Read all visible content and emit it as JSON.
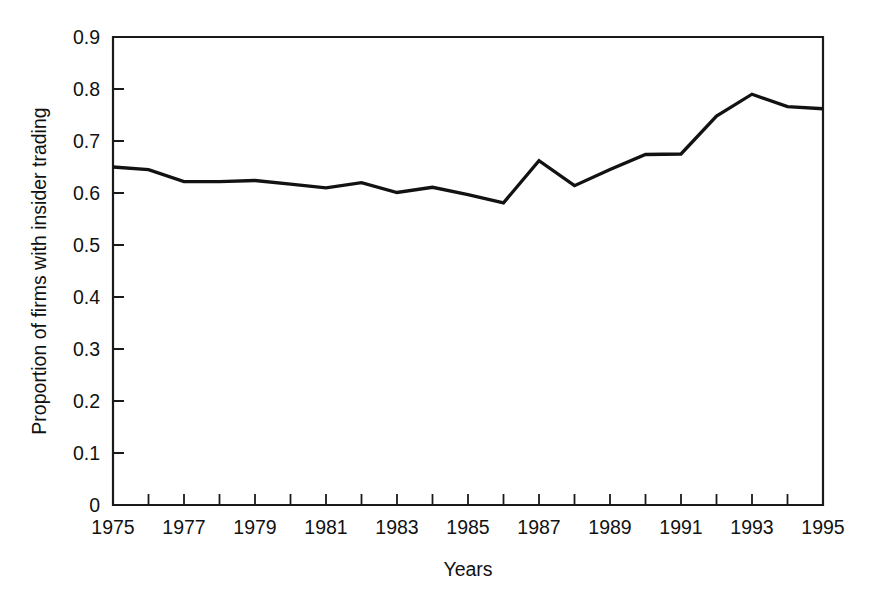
{
  "chart_data": {
    "type": "line",
    "title": "",
    "xlabel": "Years",
    "ylabel": "Proportion of firms with insider trading",
    "xlim": [
      1975,
      1995
    ],
    "ylim": [
      0,
      0.9
    ],
    "grid": false,
    "legend": "none",
    "x": [
      1975,
      1976,
      1977,
      1978,
      1979,
      1980,
      1981,
      1982,
      1983,
      1984,
      1985,
      1986,
      1987,
      1988,
      1989,
      1990,
      1991,
      1992,
      1993,
      1994,
      1995
    ],
    "values": [
      0.65,
      0.645,
      0.622,
      0.622,
      0.624,
      0.617,
      0.61,
      0.62,
      0.601,
      0.611,
      0.597,
      0.581,
      0.662,
      0.614,
      0.645,
      0.674,
      0.675,
      0.748,
      0.79,
      0.766,
      0.762
    ],
    "series": [
      {
        "name": "Proportion of firms with insider trading",
        "values": [
          0.65,
          0.645,
          0.622,
          0.622,
          0.624,
          0.617,
          0.61,
          0.62,
          0.601,
          0.611,
          0.597,
          0.581,
          0.662,
          0.614,
          0.645,
          0.674,
          0.675,
          0.748,
          0.79,
          0.766,
          0.762
        ],
        "color": "#121212"
      }
    ],
    "x_tick_labels": [
      "1975",
      "1977",
      "1979",
      "1981",
      "1983",
      "1985",
      "1987",
      "1989",
      "1991",
      "1993",
      "1995"
    ],
    "x_tick_values": [
      1975,
      1977,
      1979,
      1981,
      1983,
      1985,
      1987,
      1989,
      1991,
      1993,
      1995
    ],
    "x_minor_tick_values": [
      1976,
      1978,
      1980,
      1982,
      1984,
      1986,
      1988,
      1990,
      1992,
      1994
    ],
    "y_tick_labels": [
      "0",
      "0.1",
      "0.2",
      "0.3",
      "0.4",
      "0.5",
      "0.6",
      "0.7",
      "0.8",
      "0.9"
    ],
    "y_tick_values": [
      0,
      0.1,
      0.2,
      0.3,
      0.4,
      0.5,
      0.6,
      0.7,
      0.8,
      0.9
    ]
  },
  "figure": {
    "background_color": "#ffffff",
    "line_color": "#121212",
    "axis_color": "#1a1a1a"
  }
}
